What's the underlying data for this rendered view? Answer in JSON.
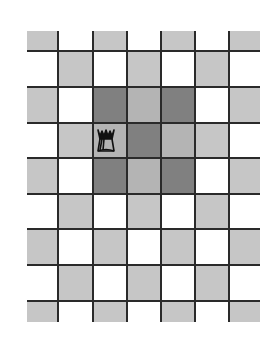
{
  "diagram": {
    "type": "chessboard-fragment",
    "columns": 7,
    "rows": 9,
    "col_edges": [
      27,
      58,
      93,
      127,
      161,
      195,
      229,
      260
    ],
    "row_edges": [
      31,
      51,
      87,
      123,
      158,
      194,
      229,
      265,
      301,
      322
    ],
    "colors": {
      "light_square": "#ffffff",
      "dark_square": "#c6c6c6",
      "highlight_on_dark": "#808080",
      "highlight_on_light": "#b4b4b4",
      "grid_line": "#2a2a2a"
    },
    "highlight": {
      "row_start": 2,
      "row_end": 4,
      "col_start": 2,
      "col_end": 4
    },
    "piece": {
      "name": "queen",
      "glyph": "♛",
      "row": 3,
      "col": 2,
      "color": "#111111"
    }
  }
}
